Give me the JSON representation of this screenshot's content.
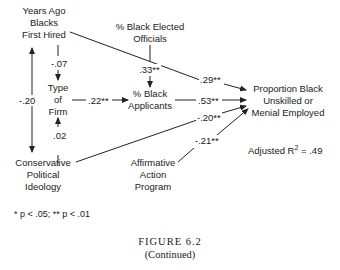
{
  "nodes": {
    "years_ago": [
      "Years Ago",
      "Blacks",
      "First Hired"
    ],
    "elected": [
      "% Black Elected",
      "Officials"
    ],
    "type_firm": [
      "Type",
      "of",
      "Firm"
    ],
    "applicants": [
      "% Black",
      "Applicants"
    ],
    "outcome": [
      "Proportion Black",
      "Unskilled or",
      "Menial Employed"
    ],
    "conservative": [
      "Conservative",
      "Political",
      "Ideology"
    ],
    "affirmative": [
      "Affirmative",
      "Action",
      "Program"
    ]
  },
  "coefficients": {
    "years_to_type": "-.07",
    "years_conservative": "-.20",
    "conservative_to_type": ".02",
    "type_to_applicants": ".22**",
    "elected_to_applicants": ".33**",
    "years_to_outcome": ".29**",
    "applicants_to_outcome": ".53**",
    "conservative_to_outcome": "-.20**",
    "affirmative_to_outcome": "-.21**"
  },
  "fit": {
    "label": "Adjusted R",
    "sup": "2",
    "value": " = .49"
  },
  "significance_note": "* p < .05; ** p < .01",
  "caption": {
    "figure": "FIGURE 6.2",
    "sub": "(Continued)"
  },
  "colors": {
    "line": "#222222",
    "text": "#1a1a1a"
  }
}
